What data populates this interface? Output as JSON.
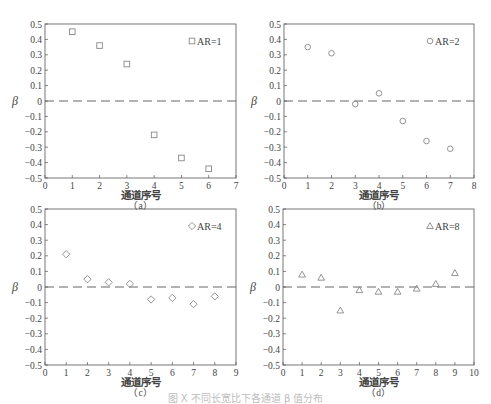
{
  "chart_data": [
    {
      "id": "a",
      "type": "scatter",
      "sublabel": "（a）",
      "xlabel": "通道序号",
      "ylabel": "β",
      "xlim": [
        0,
        7
      ],
      "ylim": [
        -0.5,
        0.5
      ],
      "xticks": [
        0,
        1,
        2,
        3,
        4,
        5,
        6,
        7
      ],
      "yticks": [
        0.5,
        0.4,
        0.3,
        0.2,
        0.1,
        0,
        -0.1,
        -0.2,
        -0.3,
        -0.4,
        -0.5
      ],
      "marker": "square",
      "legend": "AR=1",
      "reference_line": {
        "y": 0,
        "style": "dashed"
      },
      "x": [
        1,
        2,
        3,
        4,
        5,
        6
      ],
      "y": [
        0.45,
        0.36,
        0.24,
        -0.22,
        -0.37,
        -0.44
      ]
    },
    {
      "id": "b",
      "type": "scatter",
      "sublabel": "（b）",
      "xlabel": "通道序号",
      "ylabel": "β",
      "xlim": [
        0,
        8
      ],
      "ylim": [
        -0.5,
        0.5
      ],
      "xticks": [
        0,
        1,
        2,
        3,
        4,
        5,
        6,
        7,
        8
      ],
      "yticks": [
        0.5,
        0.4,
        0.3,
        0.2,
        0.1,
        0,
        -0.1,
        -0.2,
        -0.3,
        -0.4,
        -0.5
      ],
      "marker": "circle",
      "legend": "AR=2",
      "reference_line": {
        "y": 0,
        "style": "dashed"
      },
      "x": [
        1,
        2,
        3,
        4,
        5,
        6,
        7
      ],
      "y": [
        0.35,
        0.31,
        -0.02,
        0.05,
        -0.13,
        -0.26,
        -0.31
      ]
    },
    {
      "id": "c",
      "type": "scatter",
      "sublabel": "（c）",
      "xlabel": "通道序号",
      "ylabel": "β",
      "xlim": [
        0,
        9
      ],
      "ylim": [
        -0.5,
        0.5
      ],
      "xticks": [
        0,
        1,
        2,
        3,
        4,
        5,
        6,
        7,
        8,
        9
      ],
      "yticks": [
        0.5,
        0.4,
        0.3,
        0.2,
        0.1,
        0,
        -0.1,
        -0.2,
        -0.3,
        -0.4,
        -0.5
      ],
      "marker": "diamond",
      "legend": "AR=4",
      "reference_line": {
        "y": 0,
        "style": "dashed"
      },
      "x": [
        1,
        2,
        3,
        4,
        5,
        6,
        7,
        8
      ],
      "y": [
        0.21,
        0.05,
        0.03,
        0.02,
        -0.08,
        -0.07,
        -0.11,
        -0.06
      ]
    },
    {
      "id": "d",
      "type": "scatter",
      "sublabel": "（d）",
      "xlabel": "通道序号",
      "ylabel": "β",
      "xlim": [
        0,
        10
      ],
      "ylim": [
        -0.5,
        0.5
      ],
      "xticks": [
        0,
        1,
        2,
        3,
        4,
        5,
        6,
        7,
        8,
        9,
        10
      ],
      "yticks": [
        0.5,
        0.4,
        0.3,
        0.2,
        0.1,
        0,
        -0.1,
        -0.2,
        -0.3,
        -0.4,
        -0.5
      ],
      "marker": "triangle",
      "legend": "AR=8",
      "reference_line": {
        "y": 0,
        "style": "dashed"
      },
      "x": [
        1,
        2,
        3,
        4,
        5,
        6,
        7,
        8,
        9
      ],
      "y": [
        0.08,
        0.06,
        -0.15,
        -0.02,
        -0.03,
        -0.03,
        -0.01,
        0.02,
        0.09
      ]
    }
  ],
  "layout": {
    "panels": [
      {
        "left": 45,
        "top": 24,
        "width": 191,
        "height": 154
      },
      {
        "left": 284,
        "top": 24,
        "width": 190,
        "height": 154
      },
      {
        "left": 45,
        "top": 209,
        "width": 191,
        "height": 156
      },
      {
        "left": 283,
        "top": 209,
        "width": 191,
        "height": 156
      }
    ],
    "colors": {
      "axis": "#555555",
      "marker": "#888888",
      "text": "#444444"
    }
  },
  "caption": "图 X  不同长宽比下各通道 β 值分布"
}
